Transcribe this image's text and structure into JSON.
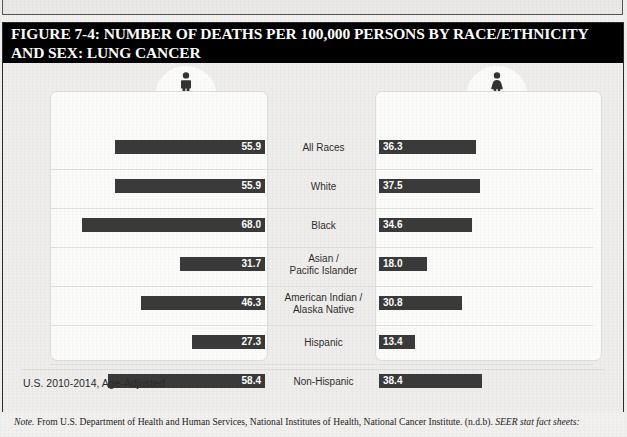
{
  "figure": {
    "title": "FIGURE 7-4: NUMBER OF DEATHS PER 100,000 PERSONS BY RACE/ETHNICITY AND SEX: LUNG CANCER",
    "footnote": "U.S. 2010-2014, Age-Adjusted",
    "note_prefix": "Note.",
    "note_body": " From U.S. Department of Health and Human Services, National Institutes of Health, National Cancer Institute. (n.d.b). ",
    "note_italic": "SEER stat fact sheets:"
  },
  "panels": {
    "male_label": "MALE",
    "female_label": "FEMALE",
    "male_icon": "male-figure-icon",
    "female_icon": "female-figure-icon"
  },
  "colors": {
    "bar": "#3a3a3a",
    "panel": "#fbfbfa",
    "background": "#eeedeb",
    "title_bar": "#000000",
    "value_text": "#ffffff"
  },
  "chart_data": {
    "type": "bar",
    "title": "FIGURE 7-4: NUMBER OF DEATHS PER 100,000 PERSONS BY RACE/ETHNICITY AND SEX: LUNG CANCER",
    "subtitle": "U.S. 2010-2014, Age-Adjusted",
    "orientation": "horizontal-diverging",
    "xlabel": "Deaths per 100,000 persons",
    "ylabel": "",
    "categories": [
      "All Races",
      "White",
      "Black",
      "Asian /\nPacific Islander",
      "American Indian /\nAlaska Native",
      "Hispanic",
      "Non-Hispanic"
    ],
    "series": [
      {
        "name": "MALE",
        "values": [
          55.9,
          55.9,
          68.0,
          31.7,
          46.3,
          27.3,
          58.4
        ]
      },
      {
        "name": "FEMALE",
        "values": [
          36.3,
          37.5,
          34.6,
          18.0,
          30.8,
          13.4,
          38.4
        ]
      }
    ],
    "xlim": [
      0,
      80
    ],
    "grid": false,
    "legend": "panel-headers",
    "value_labels": true
  }
}
